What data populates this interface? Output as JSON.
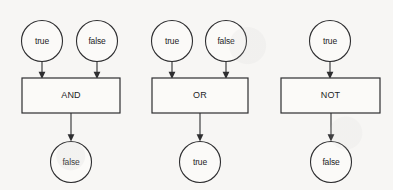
{
  "diagram": {
    "background_color": "#f7f6f4",
    "stroke_color": "#2e2e30",
    "shape_fill": "#fbfaf8",
    "groups": [
      {
        "id": "and-group",
        "gate_label": "AND",
        "inputs": [
          {
            "label": "true",
            "cx": 42,
            "cy": 41
          },
          {
            "label": "false",
            "cx": 97,
            "cy": 41
          }
        ],
        "gate": {
          "x": 22,
          "y": 78,
          "width": 98,
          "height": 35,
          "cx": 71,
          "cy": 95.5
        },
        "output": {
          "label": "false",
          "cx": 71,
          "cy": 162
        }
      },
      {
        "id": "or-group",
        "gate_label": "OR",
        "inputs": [
          {
            "label": "true",
            "cx": 172,
            "cy": 41
          },
          {
            "label": "false",
            "cx": 226,
            "cy": 41
          }
        ],
        "gate": {
          "x": 152,
          "y": 78,
          "width": 96,
          "height": 35,
          "cx": 200,
          "cy": 95.5
        },
        "output": {
          "label": "true",
          "cx": 200,
          "cy": 162
        }
      },
      {
        "id": "not-group",
        "gate_label": "NOT",
        "inputs": [
          {
            "label": "true",
            "cx": 330,
            "cy": 41
          }
        ],
        "gate": {
          "x": 281,
          "y": 78,
          "width": 99,
          "height": 35,
          "cx": 330.5,
          "cy": 95.5
        },
        "output": {
          "label": "false",
          "cx": 331,
          "cy": 162
        }
      }
    ]
  }
}
